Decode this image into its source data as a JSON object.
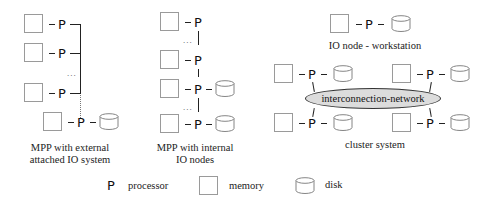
{
  "diagram": {
    "processor_glyph": "P",
    "ellipsis": "...",
    "panels": [
      {
        "id": "mpp-external",
        "label_lines": [
          "MPP with external",
          "attached IO system"
        ]
      },
      {
        "id": "mpp-internal",
        "label_lines": [
          "MPP with internal",
          "IO nodes"
        ]
      },
      {
        "id": "io-node",
        "label": "IO node - workstation"
      },
      {
        "id": "cluster",
        "label": "cluster system",
        "network_label": "interconnection-network"
      }
    ],
    "legend": [
      {
        "symbol": "P",
        "icon": "processor-icon",
        "label": "processor"
      },
      {
        "icon": "memory-icon",
        "label": "memory"
      },
      {
        "icon": "disk-icon",
        "label": "disk"
      }
    ]
  },
  "colors": {
    "line": "#222222",
    "box_border": "#9a9a9a",
    "network_fill": "#dcdcdc"
  }
}
